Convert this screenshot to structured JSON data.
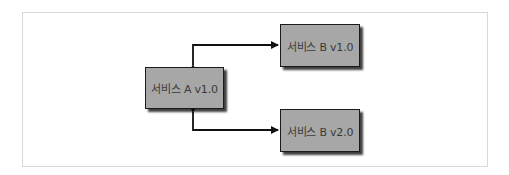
{
  "diagram": {
    "nodes": [
      {
        "id": "service-a-v1",
        "label": "서비스 A v1.0"
      },
      {
        "id": "service-b-v1",
        "label": "서비스 B v1.0"
      },
      {
        "id": "service-b-v2",
        "label": "서비스 B v2.0"
      }
    ],
    "edges": [
      {
        "from": "service-a-v1",
        "to": "service-b-v1",
        "bidirectional": true
      },
      {
        "from": "service-a-v1",
        "to": "service-b-v2",
        "bidirectional": true
      }
    ],
    "colors": {
      "node_fill": "#a7a7a7",
      "node_border": "#1a1a1a",
      "edge": "#111111",
      "frame_border": "#d8d8d8"
    }
  }
}
